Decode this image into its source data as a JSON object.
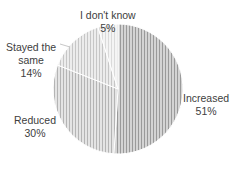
{
  "chart_data": {
    "type": "pie",
    "title": "",
    "categories": [
      "Increased",
      "Reduced",
      "Stayed the same",
      "I don't know"
    ],
    "values": [
      51,
      30,
      14,
      5
    ],
    "labels": [
      {
        "name": "Increased",
        "pct": "51%"
      },
      {
        "name": "Reduced",
        "pct": "30%"
      },
      {
        "name": "Stayed the same",
        "name_line1": "Stayed the",
        "name_line2": "same",
        "pct": "14%"
      },
      {
        "name": "I don't know",
        "pct": "5%"
      }
    ],
    "legend": "none",
    "start_angle": "12 o'clock, clockwise"
  }
}
